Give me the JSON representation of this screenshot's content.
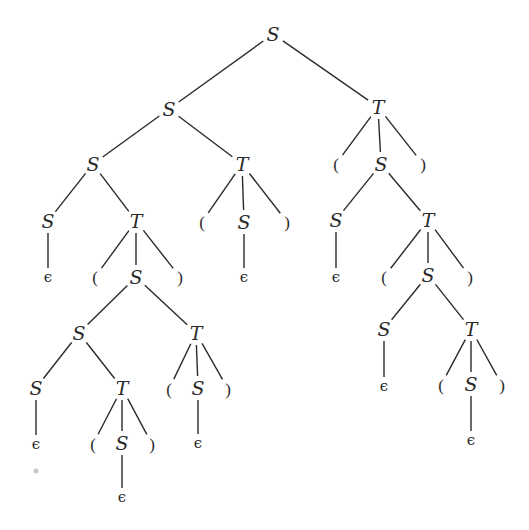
{
  "diagram": {
    "type": "parse-tree",
    "grammar_symbols": {
      "start": "S",
      "other": "T",
      "open": "(",
      "close": ")",
      "empty": "ϵ"
    },
    "line_color": "#2a2a2a",
    "nodes": [
      {
        "id": "n0",
        "label": "S",
        "kind": "nt",
        "x": 273,
        "y": 34
      },
      {
        "id": "n1",
        "label": "S",
        "kind": "nt",
        "x": 169,
        "y": 109
      },
      {
        "id": "n2",
        "label": "T",
        "kind": "nt",
        "x": 378,
        "y": 107
      },
      {
        "id": "n3",
        "label": "S",
        "kind": "nt",
        "x": 93,
        "y": 164
      },
      {
        "id": "n4",
        "label": "T",
        "kind": "nt",
        "x": 242,
        "y": 164
      },
      {
        "id": "n5",
        "label": "(",
        "kind": "term",
        "x": 336,
        "y": 164
      },
      {
        "id": "n6",
        "label": "S",
        "kind": "nt",
        "x": 381,
        "y": 164
      },
      {
        "id": "n7",
        "label": ")",
        "kind": "term",
        "x": 423,
        "y": 164
      },
      {
        "id": "n8",
        "label": "S",
        "kind": "nt",
        "x": 48,
        "y": 221
      },
      {
        "id": "n9",
        "label": "T",
        "kind": "nt",
        "x": 136,
        "y": 221
      },
      {
        "id": "n10",
        "label": "(",
        "kind": "term",
        "x": 202,
        "y": 222
      },
      {
        "id": "n11",
        "label": "S",
        "kind": "nt",
        "x": 244,
        "y": 222
      },
      {
        "id": "n12",
        "label": ")",
        "kind": "term",
        "x": 287,
        "y": 222
      },
      {
        "id": "n13",
        "label": "S",
        "kind": "nt",
        "x": 336,
        "y": 220
      },
      {
        "id": "n14",
        "label": "T",
        "kind": "nt",
        "x": 428,
        "y": 220
      },
      {
        "id": "n15",
        "label": "ϵ",
        "kind": "eps",
        "x": 48,
        "y": 277
      },
      {
        "id": "n16",
        "label": "(",
        "kind": "term",
        "x": 95,
        "y": 277
      },
      {
        "id": "n17",
        "label": "S",
        "kind": "nt",
        "x": 136,
        "y": 277
      },
      {
        "id": "n18",
        "label": ")",
        "kind": "term",
        "x": 180,
        "y": 277
      },
      {
        "id": "n19",
        "label": "ϵ",
        "kind": "eps",
        "x": 244,
        "y": 277
      },
      {
        "id": "n20",
        "label": "ϵ",
        "kind": "eps",
        "x": 336,
        "y": 277
      },
      {
        "id": "n21",
        "label": "(",
        "kind": "term",
        "x": 384,
        "y": 277
      },
      {
        "id": "n22",
        "label": "S",
        "kind": "nt",
        "x": 428,
        "y": 275
      },
      {
        "id": "n23",
        "label": ")",
        "kind": "term",
        "x": 470,
        "y": 277
      },
      {
        "id": "n24",
        "label": "S",
        "kind": "nt",
        "x": 79,
        "y": 333
      },
      {
        "id": "n25",
        "label": "T",
        "kind": "nt",
        "x": 196,
        "y": 333
      },
      {
        "id": "n26",
        "label": "S",
        "kind": "nt",
        "x": 384,
        "y": 329
      },
      {
        "id": "n27",
        "label": "T",
        "kind": "nt",
        "x": 471,
        "y": 329
      },
      {
        "id": "n28",
        "label": "S",
        "kind": "nt",
        "x": 36,
        "y": 388
      },
      {
        "id": "n29",
        "label": "T",
        "kind": "nt",
        "x": 122,
        "y": 388
      },
      {
        "id": "n30",
        "label": "(",
        "kind": "term",
        "x": 169,
        "y": 389
      },
      {
        "id": "n31",
        "label": "S",
        "kind": "nt",
        "x": 198,
        "y": 388
      },
      {
        "id": "n32",
        "label": ")",
        "kind": "term",
        "x": 228,
        "y": 389
      },
      {
        "id": "n33",
        "label": "ϵ",
        "kind": "eps",
        "x": 384,
        "y": 386
      },
      {
        "id": "n34",
        "label": "(",
        "kind": "term",
        "x": 441,
        "y": 385
      },
      {
        "id": "n35",
        "label": "S",
        "kind": "nt",
        "x": 471,
        "y": 384
      },
      {
        "id": "n36",
        "label": ")",
        "kind": "term",
        "x": 502,
        "y": 385
      },
      {
        "id": "n37",
        "label": "ϵ",
        "kind": "eps",
        "x": 36,
        "y": 444
      },
      {
        "id": "n38",
        "label": "(",
        "kind": "term",
        "x": 93,
        "y": 444
      },
      {
        "id": "n39",
        "label": "S",
        "kind": "nt",
        "x": 122,
        "y": 443
      },
      {
        "id": "n40",
        "label": ")",
        "kind": "term",
        "x": 152,
        "y": 444
      },
      {
        "id": "n41",
        "label": "ϵ",
        "kind": "eps",
        "x": 198,
        "y": 443
      },
      {
        "id": "n42",
        "label": "ϵ",
        "kind": "eps",
        "x": 471,
        "y": 440
      },
      {
        "id": "n43",
        "label": "ϵ",
        "kind": "eps",
        "x": 122,
        "y": 497
      }
    ],
    "edges": [
      [
        "n0",
        "n1"
      ],
      [
        "n0",
        "n2"
      ],
      [
        "n1",
        "n3"
      ],
      [
        "n1",
        "n4"
      ],
      [
        "n2",
        "n5"
      ],
      [
        "n2",
        "n6"
      ],
      [
        "n2",
        "n7"
      ],
      [
        "n3",
        "n8"
      ],
      [
        "n3",
        "n9"
      ],
      [
        "n4",
        "n10"
      ],
      [
        "n4",
        "n11"
      ],
      [
        "n4",
        "n12"
      ],
      [
        "n6",
        "n13"
      ],
      [
        "n6",
        "n14"
      ],
      [
        "n8",
        "n15"
      ],
      [
        "n9",
        "n16"
      ],
      [
        "n9",
        "n17"
      ],
      [
        "n9",
        "n18"
      ],
      [
        "n11",
        "n19"
      ],
      [
        "n13",
        "n20"
      ],
      [
        "n14",
        "n21"
      ],
      [
        "n14",
        "n22"
      ],
      [
        "n14",
        "n23"
      ],
      [
        "n17",
        "n24"
      ],
      [
        "n17",
        "n25"
      ],
      [
        "n22",
        "n26"
      ],
      [
        "n22",
        "n27"
      ],
      [
        "n24",
        "n28"
      ],
      [
        "n24",
        "n29"
      ],
      [
        "n25",
        "n30"
      ],
      [
        "n25",
        "n31"
      ],
      [
        "n25",
        "n32"
      ],
      [
        "n26",
        "n33"
      ],
      [
        "n27",
        "n34"
      ],
      [
        "n27",
        "n35"
      ],
      [
        "n27",
        "n36"
      ],
      [
        "n28",
        "n37"
      ],
      [
        "n29",
        "n38"
      ],
      [
        "n29",
        "n39"
      ],
      [
        "n29",
        "n40"
      ],
      [
        "n31",
        "n41"
      ],
      [
        "n35",
        "n42"
      ],
      [
        "n39",
        "n43"
      ]
    ],
    "artifacts": [
      {
        "kind": "gray-dot",
        "x": 36,
        "y": 471
      }
    ]
  }
}
